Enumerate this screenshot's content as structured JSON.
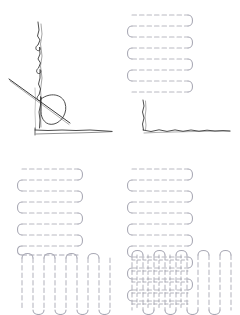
{
  "figure": {
    "panel_count": 4,
    "layout": "2x2 grid",
    "background_color": "#ffffff"
  },
  "colors": {
    "sketch_stroke": "#3a3a3a",
    "path_light": "#b9b9c2",
    "path_medium": "#9a9aa6",
    "path_dark": "#7d7d8a",
    "background": "#ffffff"
  },
  "panels": [
    {
      "id": "outline",
      "name": "region-outline-sketch",
      "position": "top-left",
      "description": "Hand-sketched L-shaped region boundary with a diagonal guide line and a loop",
      "elements": [
        "vertical-sketch-edge",
        "horizontal-sketch-baseline",
        "diagonal-guide-line",
        "teardrop-loop"
      ]
    },
    {
      "id": "horizontal-sweep",
      "name": "horizontal-boustrophedon-panel",
      "position": "top-right",
      "description": "Horizontal serpentine coverage path filling the vertical arm of the L region",
      "path": {
        "type": "boustrophedon",
        "orientation": "horizontal",
        "rows": 8,
        "dashed": true,
        "rounded_turns": true
      },
      "elements": [
        "horizontal-serpentine-block",
        "vertical-sketch-edge",
        "horizontal-sketch-baseline"
      ]
    },
    {
      "id": "partial-coverage",
      "name": "partial-coverage-panel",
      "position": "bottom-left",
      "description": "Horizontal serpentine over the vertical arm plus vertical serpentine over the horizontal arm, non-overlapping",
      "paths": [
        {
          "type": "boustrophedon",
          "orientation": "horizontal",
          "rows": 8,
          "dashed": true,
          "rounded_turns": true
        },
        {
          "type": "boustrophedon",
          "orientation": "vertical",
          "columns": 9,
          "dashed": true,
          "rounded_turns": true
        }
      ],
      "elements": [
        "horizontal-serpentine-block",
        "vertical-serpentine-block"
      ]
    },
    {
      "id": "complete-coverage",
      "name": "complete-coverage-panel",
      "position": "bottom-right",
      "description": "Full coverage where horizontal and vertical serpentine paths overlap in the corner producing a cross-hatched region",
      "paths": [
        {
          "type": "boustrophedon",
          "orientation": "horizontal",
          "rows": 12,
          "dashed": true,
          "rounded_turns": true
        },
        {
          "type": "boustrophedon",
          "orientation": "vertical",
          "columns": 9,
          "dashed": true,
          "rounded_turns": true
        }
      ],
      "overlap_region": {
        "name": "cross-hatch-overlap",
        "description": "Corner area covered by both horizontal and vertical passes"
      },
      "elements": [
        "horizontal-serpentine-block",
        "vertical-serpentine-block",
        "cross-hatch-overlap"
      ]
    }
  ]
}
